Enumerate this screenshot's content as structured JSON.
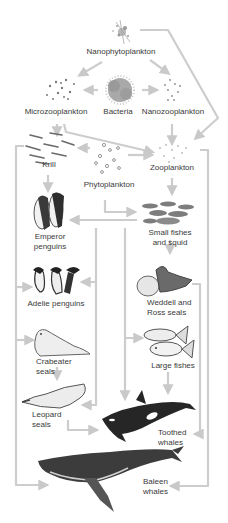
{
  "diagram": {
    "type": "food-web",
    "arrow_color": "#c9c9c9",
    "nodes": {
      "nanophytoplankton": "Nanophytoplankton",
      "microzooplankton": "Microzooplankton",
      "bacteria": "Bacteria",
      "nanozooplankton": "Nanozooplankton",
      "krill": "Krill",
      "phytoplankton": "Phytoplankton",
      "zooplankton": "Zooplankton",
      "emperor_penguins": "Emperor\npenguins",
      "small_fishes_squid": "Small fishes\nand squid",
      "adelie_penguins": "Adelie penguins",
      "weddell_ross_seals": "Weddell and\nRoss seals",
      "crabeater_seals": "Crabeater\nseals",
      "large_fishes": "Large fishes",
      "leopard_seals": "Leopard\nseals",
      "toothed_whales": "Toothed\nwhales",
      "baleen_whales": "Baleen\nwhales"
    },
    "edges": [
      [
        "Nanophytoplankton",
        "Microzooplankton"
      ],
      [
        "Nanophytoplankton",
        "Nanozooplankton"
      ],
      [
        "Nanophytoplankton",
        "Zooplankton"
      ],
      [
        "Bacteria",
        "Microzooplankton"
      ],
      [
        "Bacteria",
        "Nanozooplankton"
      ],
      [
        "Microzooplankton",
        "Krill"
      ],
      [
        "Microzooplankton",
        "Zooplankton"
      ],
      [
        "Nanozooplankton",
        "Zooplankton"
      ],
      [
        "Phytoplankton",
        "Krill"
      ],
      [
        "Phytoplankton",
        "Zooplankton"
      ],
      [
        "Phytoplankton",
        "Small fishes and squid"
      ],
      [
        "Krill",
        "Emperor penguins"
      ],
      [
        "Krill",
        "Adelie penguins"
      ],
      [
        "Krill",
        "Crabeater seals"
      ],
      [
        "Krill",
        "Baleen whales"
      ],
      [
        "Zooplankton",
        "Small fishes and squid"
      ],
      [
        "Zooplankton",
        "Baleen whales"
      ],
      [
        "Small fishes and squid",
        "Emperor penguins"
      ],
      [
        "Small fishes and squid",
        "Adelie penguins"
      ],
      [
        "Small fishes and squid",
        "Weddell and Ross seals"
      ],
      [
        "Small fishes and squid",
        "Large fishes"
      ],
      [
        "Small fishes and squid",
        "Toothed whales"
      ],
      [
        "Adelie penguins",
        "Leopard seals"
      ],
      [
        "Crabeater seals",
        "Leopard seals"
      ],
      [
        "Leopard seals",
        "Toothed whales"
      ],
      [
        "Large fishes",
        "Toothed whales"
      ],
      [
        "Weddell and Ross seals",
        "Toothed whales"
      ]
    ]
  }
}
